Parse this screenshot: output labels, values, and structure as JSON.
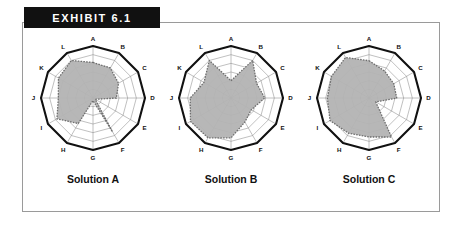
{
  "banner": {
    "label": "EXHIBIT 6.1"
  },
  "colors": {
    "banner_bg": "#111111",
    "banner_text": "#ffffff",
    "frame_border": "#9a9a9a",
    "page_bg": "#ffffff",
    "outer_polygon": "#111111",
    "grid_line": "#8c8c8c",
    "data_fill": "#b3b3b3",
    "data_outline": "#6e6e6e",
    "label_text": "#111111"
  },
  "chart_common": {
    "axes": [
      "A",
      "B",
      "C",
      "D",
      "E",
      "F",
      "G",
      "H",
      "I",
      "J",
      "K",
      "L"
    ],
    "rings": 6,
    "max_value": 6,
    "grid": true,
    "legend": "none"
  },
  "chart_data": [
    {
      "type": "radar",
      "title": "Solution A",
      "categories": [
        "A",
        "B",
        "C",
        "D",
        "E",
        "F",
        "G",
        "H",
        "I",
        "J",
        "K",
        "L"
      ],
      "values": [
        4.1,
        4.0,
        3.4,
        2.7,
        0.3,
        4.5,
        0.3,
        3.4,
        4.8,
        4.0,
        4.6,
        5.0
      ],
      "ylim": [
        0,
        6
      ],
      "rings": 6,
      "grid": true
    },
    {
      "type": "radar",
      "title": "Solution B",
      "categories": [
        "A",
        "B",
        "C",
        "D",
        "E",
        "F",
        "G",
        "H",
        "I",
        "J",
        "K",
        "L"
      ],
      "values": [
        2.0,
        5.0,
        3.4,
        3.9,
        2.7,
        3.2,
        4.6,
        5.3,
        5.4,
        4.7,
        3.6,
        5.0
      ],
      "ylim": [
        0,
        6
      ],
      "rings": 6,
      "grid": true
    },
    {
      "type": "radar",
      "title": "Solution C",
      "categories": [
        "A",
        "B",
        "C",
        "D",
        "E",
        "F",
        "G",
        "H",
        "I",
        "J",
        "K",
        "L"
      ],
      "values": [
        4.3,
        3.6,
        3.3,
        3.2,
        0.9,
        5.2,
        4.5,
        4.7,
        5.2,
        4.8,
        5.0,
        5.4
      ],
      "ylim": [
        0,
        6
      ],
      "rings": 6,
      "grid": true
    }
  ],
  "captions": {
    "solution_a": "Solution A",
    "solution_b": "Solution B",
    "solution_c": "Solution C"
  }
}
